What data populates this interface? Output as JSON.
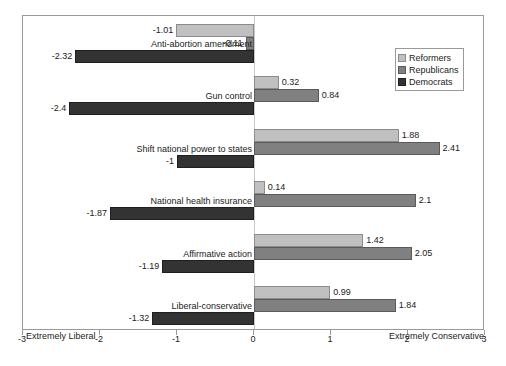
{
  "chart_data": {
    "type": "bar",
    "orientation": "horizontal",
    "title": "",
    "subtitle": "",
    "xlabel": "",
    "ylabel": "",
    "xlim": [
      -3,
      3
    ],
    "xticks": [
      -3,
      -2,
      -1,
      0,
      1,
      2,
      3
    ],
    "xtick_labels": [
      "-3",
      "-2",
      "-1",
      "0",
      "1",
      "2",
      "3"
    ],
    "grid": false,
    "zero_reference_line": true,
    "axis_end_labels": {
      "left": "Extremely Liberal",
      "right": "Extremely Conservative"
    },
    "legend": {
      "position": "top-right",
      "entries": [
        {
          "name": "Reformers",
          "color": "#c0c0c0"
        },
        {
          "name": "Republicans",
          "color": "#808080"
        },
        {
          "name": "Democrats",
          "color": "#333333"
        }
      ]
    },
    "categories": [
      "Anti-abortion amendment",
      "Gun control",
      "Shift national power to states",
      "National health insurance",
      "Affirmative action",
      "Liberal-conservative"
    ],
    "series": [
      {
        "name": "Reformers",
        "color": "#c0c0c0",
        "values": [
          -1.01,
          0.32,
          1.88,
          0.14,
          1.42,
          0.99
        ],
        "labels": [
          "-1.01",
          "0.32",
          "1.88",
          "0.14",
          "1.42",
          "0.99"
        ]
      },
      {
        "name": "Republicans",
        "color": "#808080",
        "values": [
          -0.11,
          0.84,
          2.41,
          2.1,
          2.05,
          1.84
        ],
        "labels": [
          "-0.11",
          "0.84",
          "2.41",
          "2.1",
          "2.05",
          "1.84"
        ]
      },
      {
        "name": "Democrats",
        "color": "#333333",
        "values": [
          -2.32,
          -2.4,
          -1,
          -1.87,
          -1.19,
          -1.32
        ],
        "labels": [
          "-2.32",
          "-2.4",
          "-1",
          "-1.87",
          "-1.19",
          "-1.32"
        ]
      }
    ]
  }
}
